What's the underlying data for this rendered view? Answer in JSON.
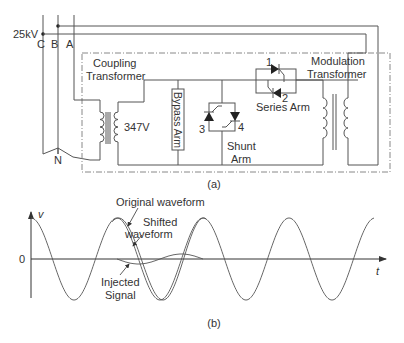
{
  "figure": {
    "part_a": {
      "caption": "(a)",
      "supply_voltage": "25kV",
      "phases": [
        "C",
        "B",
        "A"
      ],
      "neutral": "N",
      "coupling_transformer": {
        "label_line1": "Coupling",
        "label_line2": "Transformer",
        "secondary_voltage": "347V"
      },
      "bypass_arm": {
        "label": "Bypass Arm"
      },
      "series_arm": {
        "label": "Series Arm",
        "thyristors": [
          "1",
          "2"
        ]
      },
      "shunt_arm": {
        "label_line1": "Shunt",
        "label_line2": "Arm",
        "thyristors": [
          "3",
          "4"
        ]
      },
      "modulation_transformer": {
        "label_line1": "Modulation",
        "label_line2": "Transformer"
      }
    },
    "part_b": {
      "caption": "(b)",
      "y_axis_label": "v",
      "x_axis_label": "t",
      "zero_label": "0",
      "annotations": {
        "original": "Original waveform",
        "shifted_line1": "Shifted",
        "shifted_line2": "waveform",
        "injected_line1": "Injected",
        "injected_line2": "Signal"
      }
    }
  },
  "chart_data": {
    "type": "line",
    "title": "",
    "xlabel": "t",
    "ylabel": "v",
    "series": [
      {
        "name": "Original waveform",
        "description": "sinusoid, ~4.5 cycles, amplitude 1"
      },
      {
        "name": "Shifted waveform",
        "description": "same sinusoid slightly phase-shifted during ~1 cycle (between 2nd and 3rd peak)"
      },
      {
        "name": "Injected Signal",
        "description": "small-amplitude single-cycle signal (~0.1 of main amplitude) superimposed near zero between 2nd and 3rd peak"
      }
    ],
    "legend": "none (annotations with arrows)",
    "grid": false
  }
}
